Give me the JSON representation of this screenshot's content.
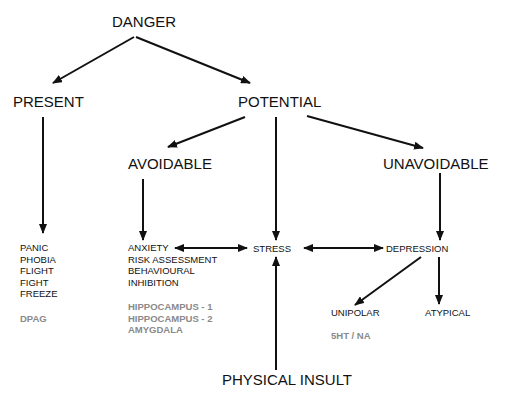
{
  "nodes": {
    "danger": "DANGER",
    "present": "PRESENT",
    "potential": "POTENTIAL",
    "avoidable": "AVOIDABLE",
    "unavoidable": "UNAVOIDABLE",
    "stress": "STRESS",
    "depression": "DEPRESSION",
    "unipolar": "UNIPOLAR",
    "atypical": "ATYPICAL",
    "physical_insult": "PHYSICAL INSULT"
  },
  "present_responses": [
    "PANIC",
    "PHOBIA",
    "FLIGHT",
    "FIGHT",
    "FREEZE"
  ],
  "present_substrate": "DPAG",
  "avoidable_responses": [
    "ANXIETY",
    "RISK ASSESSMENT",
    "BEHAVIOURAL",
    "INHIBITION"
  ],
  "avoidable_substrates": [
    "HIPPOCAMPUS - 1",
    "HIPPOCAMPUS - 2",
    "AMYGDALA"
  ],
  "depression_substrate": "5HT / NA",
  "colors": {
    "text": "#111111",
    "substrate_text": "#8a8a8a",
    "background": "#ffffff"
  }
}
